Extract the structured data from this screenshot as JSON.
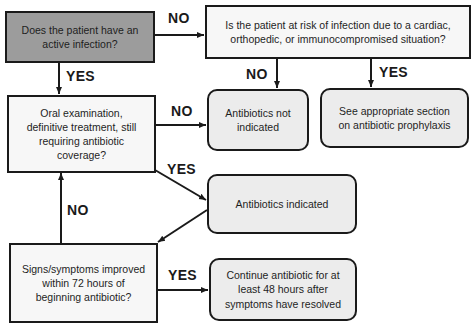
{
  "diagram": {
    "type": "flowchart",
    "nodes": {
      "active_infection": {
        "text": "Does the patient have an active infection?",
        "shape": "rectangle",
        "fill": "#9c9c9c"
      },
      "risk_question": {
        "text": "Is the patient at risk of infection due to a cardiac, orthopedic, or immunocompromised situation?",
        "shape": "rectangle",
        "fill": "#f7f7f7"
      },
      "oral_exam": {
        "text": "Oral examination, definitive treatment, still requiring antibiotic coverage?",
        "shape": "rectangle",
        "fill": "#f7f7f7"
      },
      "not_indicated": {
        "text": "Antibiotics not indicated",
        "shape": "rounded-rectangle",
        "fill": "#ececec"
      },
      "prophylaxis": {
        "text": "See appropriate section on antibiotic prophylaxis",
        "shape": "rounded-rectangle",
        "fill": "#ececec"
      },
      "indicated": {
        "text": "Antibiotics indicated",
        "shape": "rounded-rectangle",
        "fill": "#ececec"
      },
      "improved": {
        "text": "Signs/symptoms improved within 72 hours of beginning antibiotic?",
        "shape": "rectangle",
        "fill": "#f7f7f7"
      },
      "continue": {
        "text": "Continue antibiotic for at least 48 hours after symptoms have resolved",
        "shape": "rounded-rectangle",
        "fill": "#ececec"
      }
    },
    "edges": [
      {
        "from": "active_infection",
        "to": "risk_question",
        "label": "NO"
      },
      {
        "from": "active_infection",
        "to": "oral_exam",
        "label": "YES"
      },
      {
        "from": "risk_question",
        "to": "not_indicated",
        "label": "NO"
      },
      {
        "from": "risk_question",
        "to": "prophylaxis",
        "label": "YES"
      },
      {
        "from": "oral_exam",
        "to": "not_indicated",
        "label": "NO"
      },
      {
        "from": "oral_exam",
        "to": "indicated",
        "label": "YES"
      },
      {
        "from": "indicated",
        "to": "improved",
        "label": ""
      },
      {
        "from": "improved",
        "to": "oral_exam",
        "label": "NO"
      },
      {
        "from": "improved",
        "to": "continue",
        "label": "YES"
      }
    ],
    "edge_labels": {
      "active_no": "NO",
      "active_yes": "YES",
      "risk_no": "NO",
      "risk_yes": "YES",
      "oral_no": "NO",
      "oral_yes": "YES",
      "improved_no": "NO",
      "improved_yes": "YES"
    },
    "colors": {
      "stroke": "#1a1a1a",
      "dark_fill": "#9c9c9c",
      "light_fill": "#f7f7f7",
      "rounded_fill": "#ececec"
    }
  }
}
